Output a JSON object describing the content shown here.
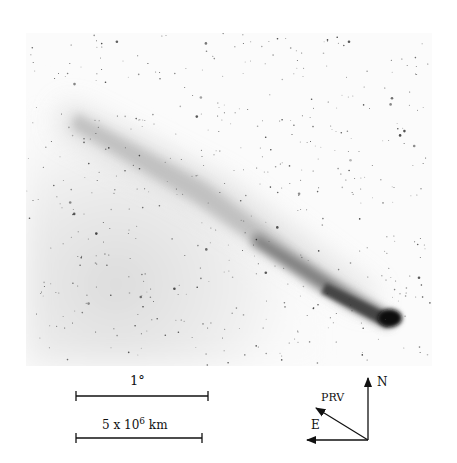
{
  "figure": {
    "colors": {
      "background": "#ffffff",
      "ink": "#111111",
      "sky_haze": "#e6e6e6",
      "nucleus": "#0a0a0a"
    }
  },
  "scale_bars": {
    "angular": {
      "label": "1°"
    },
    "distance": {
      "label_base": "5 x 10",
      "label_exponent": "6",
      "label_unit": " km"
    }
  },
  "compass": {
    "north": "N",
    "east": "E",
    "prv": "PRV"
  }
}
